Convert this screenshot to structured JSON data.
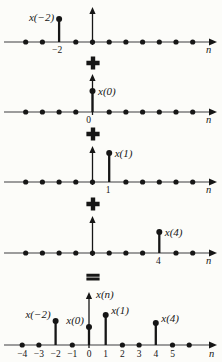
{
  "figure": {
    "title_semantic": "decomposition of discrete-time signal x(n) into weighted impulses",
    "background": "#fcfcf9",
    "ink_color": "#161616",
    "axis_color": "#7c7c7c",
    "n_min": -4,
    "n_max": 6,
    "spacing": 16.7,
    "axis_start_x": 4,
    "axis_end_x": 211,
    "n_label": "n",
    "panels": [
      {
        "id": "component-x-neg2",
        "axis_y": 42,
        "origin_x": 92.5,
        "arrow_top_y": 7,
        "stems": [
          {
            "n": -2,
            "top_y": 19,
            "label": "x(−2)",
            "side": "left",
            "label_y": 21
          }
        ],
        "ticks": [
          {
            "n": -2,
            "text": "−2",
            "dx": -2
          }
        ],
        "tick_y": 53,
        "n_label_x": 206,
        "n_label_y": 53
      },
      {
        "id": "component-x0",
        "axis_y": 112,
        "origin_x": 92.5,
        "arrow_top_y": 74,
        "stems": [
          {
            "n": 0,
            "top_y": 91,
            "label": "x(0)",
            "side": "right",
            "label_y": 95
          }
        ],
        "ticks": [
          {
            "n": 0,
            "text": "0",
            "dx": -4
          }
        ],
        "tick_y": 123,
        "n_label_x": 206,
        "n_label_y": 123
      },
      {
        "id": "component-x1",
        "axis_y": 182,
        "origin_x": 92.5,
        "arrow_top_y": 146,
        "stems": [
          {
            "n": 1,
            "top_y": 153,
            "label": "x(1)",
            "side": "right",
            "label_y": 157
          }
        ],
        "ticks": [
          {
            "n": 1,
            "text": "1",
            "dx": -1
          }
        ],
        "tick_y": 193,
        "n_label_x": 206,
        "n_label_y": 193
      },
      {
        "id": "component-x4",
        "axis_y": 253,
        "origin_x": 92.5,
        "arrow_top_y": 216,
        "stems": [
          {
            "n": 4,
            "top_y": 232,
            "label": "x(4)",
            "side": "right",
            "label_y": 236
          }
        ],
        "ticks": [
          {
            "n": 4,
            "text": "4",
            "dx": -1
          }
        ],
        "tick_y": 264,
        "n_label_x": 206,
        "n_label_y": 264
      },
      {
        "id": "sum-xn",
        "axis_y": 345,
        "origin_x": 89,
        "arrow_top_y": 292,
        "axis_label": {
          "text": "x(n)",
          "x": 96,
          "y": 298
        },
        "stems": [
          {
            "n": -2,
            "top_y": 321,
            "label": "x(−2)",
            "side": "left",
            "label_y": 318
          },
          {
            "n": 0,
            "top_y": 327,
            "label": "x(0)",
            "side": "left",
            "label_y": 324
          },
          {
            "n": 1,
            "top_y": 315,
            "label": "x(1)",
            "side": "right",
            "label_y": 314
          },
          {
            "n": 4,
            "top_y": 323,
            "label": "x(4)",
            "side": "right",
            "label_y": 322
          }
        ],
        "ticks": [
          {
            "n": -4,
            "text": "−4"
          },
          {
            "n": -3,
            "text": "−3"
          },
          {
            "n": -2,
            "text": "−2"
          },
          {
            "n": -1,
            "text": "−1"
          },
          {
            "n": 0,
            "text": "0"
          },
          {
            "n": 1,
            "text": "1"
          },
          {
            "n": 2,
            "text": "2"
          },
          {
            "n": 3,
            "text": "3"
          },
          {
            "n": 4,
            "text": "4"
          },
          {
            "n": 5,
            "text": "5"
          }
        ],
        "tick_y": 357,
        "n_label_x": 209,
        "n_label_y": 357
      }
    ],
    "operators": [
      {
        "symbol": "+",
        "cx": 93,
        "cy": 63
      },
      {
        "symbol": "+",
        "cx": 93,
        "cy": 134
      },
      {
        "symbol": "+",
        "cx": 93,
        "cy": 204
      },
      {
        "symbol": "=",
        "cx": 93,
        "cy": 277
      }
    ]
  }
}
